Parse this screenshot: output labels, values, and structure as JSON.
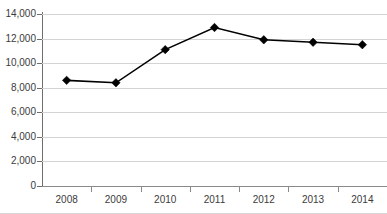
{
  "chart_data": {
    "type": "line",
    "title": "",
    "xlabel": "",
    "ylabel": "",
    "categories": [
      "2008",
      "2009",
      "2010",
      "2011",
      "2012",
      "2013",
      "2014"
    ],
    "values": [
      8600,
      8400,
      11100,
      12900,
      11900,
      11700,
      11500
    ],
    "ylim": [
      0,
      14000
    ],
    "ytick_step": 2000,
    "ytick_labels": [
      "0",
      "2,000",
      "4,000",
      "6,000",
      "8,000",
      "10,000",
      "12,000",
      "14,000"
    ],
    "ytick_values": [
      0,
      2000,
      4000,
      6000,
      8000,
      10000,
      12000,
      14000
    ],
    "grid": true,
    "legend": "none",
    "marker": "diamond",
    "series_color": "#000000",
    "grid_color": "#d4d4d4",
    "axis_color": "#6e6e6e",
    "background_color": "#ffffff"
  }
}
